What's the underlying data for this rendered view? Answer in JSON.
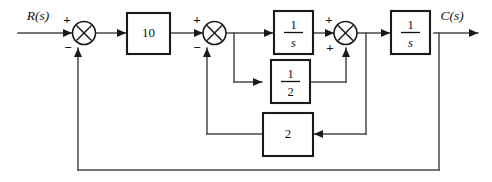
{
  "diagram": {
    "type": "control-system-block-diagram",
    "title": "",
    "input_signal": {
      "label": "R(s)"
    },
    "output_signal": {
      "label": "C(s)"
    },
    "blocks": [
      {
        "id": "gain10",
        "label": "10",
        "kind": "gain",
        "numerator": "",
        "denominator": ""
      },
      {
        "id": "int1",
        "label": "1/s",
        "kind": "integrator",
        "numerator": "1",
        "denominator": "s"
      },
      {
        "id": "half",
        "label": "1/2",
        "kind": "gain-frac",
        "numerator": "1",
        "denominator": "2"
      },
      {
        "id": "int2",
        "label": "1/s",
        "kind": "integrator",
        "numerator": "1",
        "denominator": "s"
      },
      {
        "id": "gain2",
        "label": "2",
        "kind": "gain",
        "numerator": "",
        "denominator": ""
      }
    ],
    "summing_junctions": [
      {
        "id": "sum1",
        "inputs": [
          {
            "port": "left",
            "sign": "+"
          },
          {
            "port": "bottom",
            "sign": "−"
          }
        ]
      },
      {
        "id": "sum2",
        "inputs": [
          {
            "port": "left",
            "sign": "+"
          },
          {
            "port": "bottom",
            "sign": "−"
          }
        ]
      },
      {
        "id": "sum3",
        "inputs": [
          {
            "port": "left",
            "sign": "+"
          },
          {
            "port": "bottom",
            "sign": "+"
          }
        ]
      }
    ],
    "signs": {
      "sum1_left": "+",
      "sum1_bottom": "−",
      "sum2_left": "+",
      "sum2_bottom": "−",
      "sum3_left": "+",
      "sum3_bottom": "+"
    },
    "colors": {
      "background": "#ffffff",
      "wire": "#4a4a4a",
      "block_border": "#1a1a1a",
      "text": "#111111"
    }
  }
}
